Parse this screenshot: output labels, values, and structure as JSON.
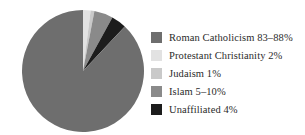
{
  "chart_data": {
    "type": "pie",
    "title": "",
    "categories": [
      "Roman Catholicism",
      "Protestant Christianity",
      "Judaism",
      "Islam",
      "Unaffiliated"
    ],
    "values": [
      88,
      2,
      1,
      5,
      4
    ],
    "value_labels": [
      "83–88%",
      "2%",
      "1%",
      "5–10%",
      "4%"
    ],
    "legend_entries": [
      "Roman Catholicism 83–88%",
      "Protestant Christianity 2%",
      "Judaism 1%",
      "Islam 5–10%",
      "Unaffiliated 4%"
    ],
    "colors": [
      "#6e6e6e",
      "#e2e2e2",
      "#c9c9c9",
      "#8a8a8a",
      "#1c1c1c"
    ],
    "legend_position": "right",
    "start_angle_deg": 0,
    "direction": "clockwise"
  },
  "legend": {
    "items": [
      {
        "label": "Roman Catholicism 83–88%",
        "color": "#6e6e6e",
        "swatch_name": "swatch-roman-catholicism"
      },
      {
        "label": "Protestant Christianity 2%",
        "color": "#e2e2e2",
        "swatch_name": "swatch-protestant-christianity"
      },
      {
        "label": "Judaism 1%",
        "color": "#c9c9c9",
        "swatch_name": "swatch-judaism"
      },
      {
        "label": "Islam 5–10%",
        "color": "#8a8a8a",
        "swatch_name": "swatch-islam"
      },
      {
        "label": "Unaffiliated 4%",
        "color": "#1c1c1c",
        "swatch_name": "swatch-unaffiliated"
      }
    ]
  }
}
